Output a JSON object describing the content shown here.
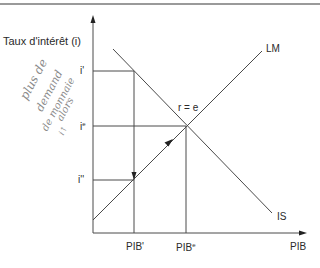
{
  "diagram": {
    "y_axis_label": "Taux d'intérêt (i)",
    "x_axis_label": "PIB",
    "curves": {
      "lm": "LM",
      "is": "IS"
    },
    "equilibrium_label": "r = e",
    "y_ticks": {
      "i_prime": "i'",
      "i_e_base": "i",
      "i_e_sup": "e",
      "i_double_prime": "i''"
    },
    "x_ticks": {
      "pib_prime": "PIB'",
      "pib_e_base": "PIB",
      "pib_e_sup": "e"
    },
    "handwritten_note": {
      "line1": "plus de",
      "line2": "demand",
      "line3": "de monnaie",
      "line4": "alors",
      "line5": "i↑"
    },
    "colors": {
      "lines": "#4a4a4a",
      "text": "#2a2a2a",
      "handwriting": "#8a8a8a",
      "top_rule": "#9a9a9a"
    }
  }
}
